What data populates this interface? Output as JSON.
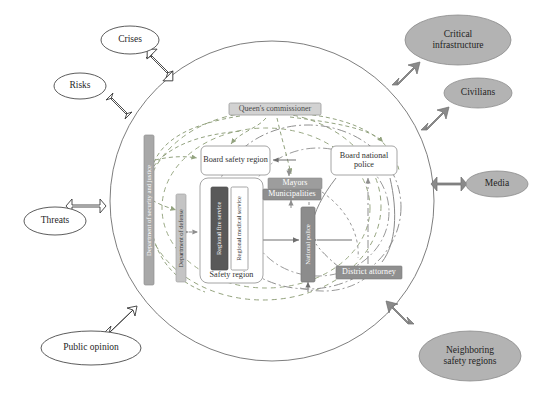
{
  "diagram": {
    "type": "systems-context-diagram",
    "colors": {
      "ellipse_fill_external": "#b3b3b3",
      "ellipse_fill_environment": "#ffffff",
      "dark_box": "#595959",
      "mid_gray_box": "#7f7f7f",
      "light_gray_bar": "#bfbfbf",
      "arrow_gray": "#808080",
      "arrow_white": "#ffffff",
      "outline": "#404040",
      "dashed_green": "#9aab86",
      "dashed_olive": "#8c9a7a",
      "dashdot_gray": "#8e8e8e"
    },
    "environment_nodes": [
      {
        "id": "crises",
        "label": "Crises",
        "style": "outline",
        "cx": 130,
        "cy": 40,
        "rx": 29,
        "ry": 14
      },
      {
        "id": "risks",
        "label": "Risks",
        "style": "outline",
        "cx": 80,
        "cy": 86,
        "rx": 26,
        "ry": 13
      },
      {
        "id": "threats",
        "label": "Threats",
        "style": "outline",
        "cx": 55,
        "cy": 221,
        "rx": 31,
        "ry": 14
      },
      {
        "id": "public-opinion",
        "label": "Public opinion",
        "style": "outline",
        "cx": 91,
        "cy": 348,
        "rx": 50,
        "ry": 17
      }
    ],
    "external_nodes": [
      {
        "id": "critical-infrastructure",
        "label": "Critical infrastructure",
        "line1": "Critical",
        "line2": "infrastructure",
        "style": "filled",
        "cx": 458,
        "cy": 40,
        "rx": 53,
        "ry": 25
      },
      {
        "id": "civilians",
        "label": "Civilians",
        "line1": "Civilians",
        "line2": "",
        "style": "filled",
        "cx": 478,
        "cy": 93,
        "rx": 34,
        "ry": 15
      },
      {
        "id": "media",
        "label": "Media",
        "line1": "Media",
        "line2": "",
        "style": "filled",
        "cx": 497,
        "cy": 184,
        "rx": 31,
        "ry": 13
      },
      {
        "id": "neighboring-safety-regions",
        "label": "Neighboring safety regions",
        "line1": "Neighboring",
        "line2": "safety regions",
        "style": "filled",
        "cx": 470,
        "cy": 356,
        "rx": 51,
        "ry": 25
      }
    ],
    "internal_nodes": [
      {
        "id": "queens-commissioner",
        "label": "Queen's commissioner",
        "shape": "gray-box",
        "x": 229,
        "y": 103,
        "w": 92,
        "h": 12
      },
      {
        "id": "board-safety-region",
        "label": "Board safety region",
        "shape": "white-rounded",
        "x": 201,
        "y": 146,
        "w": 69,
        "h": 29
      },
      {
        "id": "board-national-police",
        "label": "Board national police",
        "shape": "white-rounded",
        "x": 331,
        "y": 146,
        "w": 66,
        "h": 29
      },
      {
        "id": "mayors",
        "label": "Mayors",
        "shape": "gray-box",
        "x": 268,
        "y": 178,
        "w": 54,
        "h": 11
      },
      {
        "id": "municipalities",
        "label": "Municipalities",
        "shape": "gray-box",
        "x": 263,
        "y": 189,
        "w": 58,
        "h": 11
      },
      {
        "id": "safety-region",
        "label": "Safety region",
        "shape": "white-rounded-container",
        "x": 200,
        "y": 178,
        "w": 63,
        "h": 105
      },
      {
        "id": "regional-fire-service",
        "label": "Regional fire service",
        "shape": "dark-vertical",
        "x": 211,
        "y": 187,
        "w": 17,
        "h": 83
      },
      {
        "id": "regional-medical-service",
        "label": "Regional medical service",
        "shape": "white-vertical",
        "x": 231,
        "y": 187,
        "w": 17,
        "h": 83
      },
      {
        "id": "national-police",
        "label": "National police",
        "shape": "gray-vertical",
        "x": 301,
        "y": 207,
        "w": 14,
        "h": 73
      },
      {
        "id": "district-attorney",
        "label": "District attorney",
        "shape": "gray-box",
        "x": 336,
        "y": 266,
        "w": 66,
        "h": 13
      },
      {
        "id": "dept-security-justice",
        "label": "Department of security and justice",
        "shape": "light-vertical",
        "x": 144,
        "y": 135,
        "w": 10,
        "h": 150
      },
      {
        "id": "dept-defense",
        "label": "Department of defense",
        "shape": "light-vertical",
        "x": 176,
        "y": 194,
        "w": 10,
        "h": 88
      }
    ],
    "boundaries": [
      {
        "id": "national-system-boundary",
        "shape": "ellipse",
        "cx": 272,
        "cy": 201,
        "rx": 162,
        "ry": 160,
        "style": "solid-thin"
      },
      {
        "id": "safety-domain-boundary",
        "shape": "ellipse",
        "cx": 263,
        "cy": 205,
        "rx": 118,
        "ry": 95,
        "style": "dashed-olive"
      },
      {
        "id": "police-domain-boundary",
        "shape": "ellipse",
        "cx": 305,
        "cy": 205,
        "rx": 93,
        "ry": 83,
        "style": "dash-dot-gray"
      }
    ],
    "connector_legend": [
      {
        "style": "dashed",
        "meaning": "authority / steering relation"
      },
      {
        "style": "dash-dot",
        "meaning": "police chain relation"
      },
      {
        "style": "solid-arrow",
        "meaning": "operational coordination"
      },
      {
        "style": "block-arrow-white",
        "meaning": "environment influence"
      },
      {
        "style": "block-arrow-gray",
        "meaning": "external stakeholder interaction"
      }
    ]
  }
}
